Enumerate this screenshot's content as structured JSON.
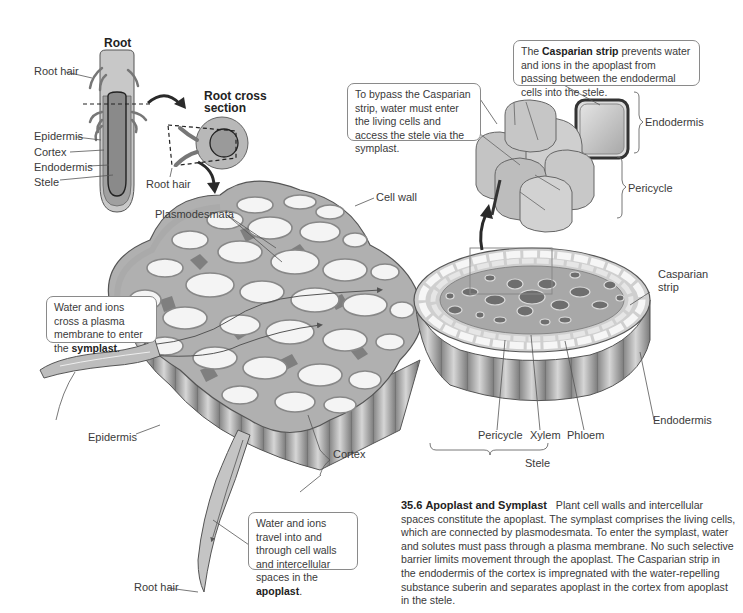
{
  "figure": {
    "number": "35.6",
    "title": "Apoplast and Symplast",
    "caption": "Plant cell walls and intercellular spaces constitute the apoplast. The symplast comprises the living cells, which are connected by plasmodesmata. To enter the symplast, water and solutes must pass through a plasma membrane. No such selective barrier limits movement through the apoplast. The Casparian strip in the endodermis of the cortex is impregnated with the water-repelling substance suberin and separates apoplast in the cortex from apoplast in the stele."
  },
  "root_panel": {
    "title": "Root",
    "labels": [
      "Root hair",
      "Epidermis",
      "Cortex",
      "Endodermis",
      "Stele"
    ]
  },
  "cross_section_panel": {
    "title_line1": "Root cross",
    "title_line2": "section",
    "root_hair_label": "Root hair"
  },
  "main_labels": {
    "cell_wall": "Cell wall",
    "plasmodesmata": "Plasmodesmata",
    "casparian_strip_line1": "Casparian",
    "casparian_strip_line2": "strip",
    "endodermis": "Endodermis",
    "pericycle": "Pericycle",
    "xylem": "Xylem",
    "phloem": "Phloem",
    "stele": "Stele",
    "cortex": "Cortex",
    "epidermis": "Epidermis",
    "root_hair": "Root hair"
  },
  "inset_labels": {
    "endodermis": "Endodermis",
    "pericycle": "Pericycle"
  },
  "callouts": {
    "casparian": {
      "pre": "The ",
      "bold": "Casparian strip",
      "post": " prevents water and ions in the apoplast from passing between the endodermal cells into the stele."
    },
    "bypass": {
      "text": "To bypass the Casparian strip, water must enter the living cells and access the stele via the symplast."
    },
    "symplast": {
      "pre": "Water and ions cross a plasma membrane to enter the ",
      "bold": "symplast",
      "post": "."
    },
    "apoplast": {
      "pre": "Water and ions travel into and through cell walls and intercellular spaces in the ",
      "bold": "apoplast",
      "post": "."
    }
  },
  "colors": {
    "line": "#4a4a4a",
    "cell_fill": "#f2f2f2",
    "wall": "#9a9a9a",
    "intercellular": "#7d7d7d",
    "root_body": "#b5b5b5",
    "root_inner": "#8f8f8f",
    "arrow": "#2a2a2a"
  }
}
